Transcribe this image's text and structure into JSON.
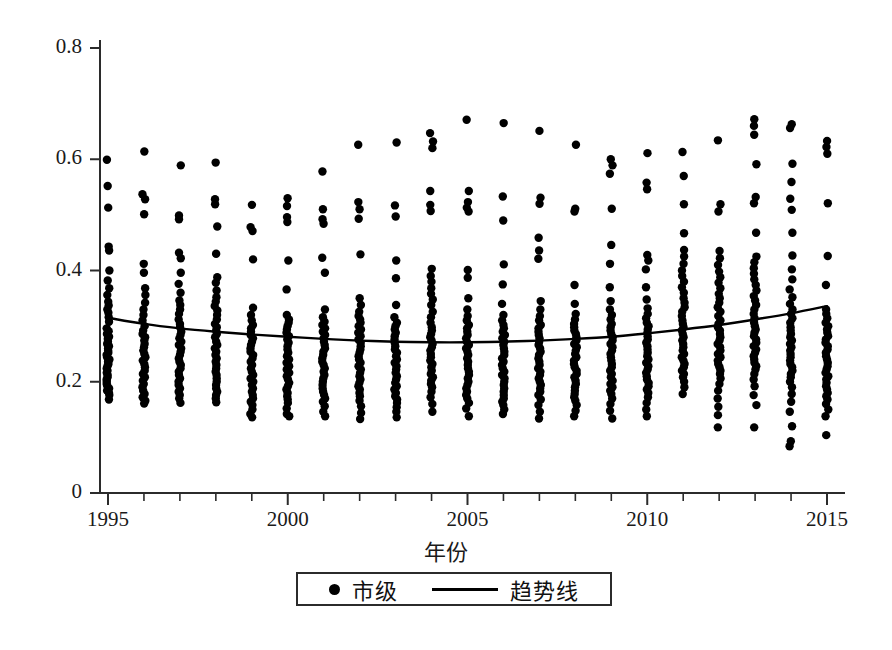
{
  "chart_data": {
    "type": "scatter",
    "title": "",
    "xlabel": "年份",
    "ylabel": "",
    "xlim": [
      1994.4,
      2015.6
    ],
    "ylim": [
      0,
      0.8
    ],
    "grid": false,
    "legend_position": "bottom-center",
    "axis_style": "open-left-bottom",
    "x_ticks": [
      1995,
      2000,
      2005,
      2010,
      2015
    ],
    "x_tick_labels": [
      "1995",
      "2000",
      "2005",
      "2010",
      "2015"
    ],
    "x_minor_ticks": [
      1996,
      1997,
      1998,
      1999,
      2001,
      2002,
      2003,
      2004,
      2006,
      2007,
      2008,
      2009,
      2011,
      2012,
      2013,
      2014
    ],
    "y_ticks": [
      0,
      0.2,
      0.4,
      0.6,
      0.8
    ],
    "y_tick_labels": [
      "0",
      "0.2",
      "0.4",
      "0.6",
      "0.8"
    ],
    "series": [
      {
        "name": "市级",
        "type": "scatter",
        "marker": "circle",
        "color": "#000000",
        "note": "Per-year vertical strip of municipal observations; dense core plus sparse high outliers.",
        "points_by_year": {
          "1995": [
            0.599,
            0.552,
            0.513,
            0.443,
            0.436,
            0.4,
            0.382,
            0.368,
            0.356,
            0.344,
            0.337,
            0.33,
            0.324,
            0.316,
            0.308,
            0.296,
            0.291,
            0.286,
            0.281,
            0.277,
            0.272,
            0.268,
            0.264,
            0.26,
            0.256,
            0.252,
            0.248,
            0.244,
            0.24,
            0.236,
            0.232,
            0.228,
            0.224,
            0.22,
            0.216,
            0.212,
            0.208,
            0.204,
            0.2,
            0.196,
            0.192,
            0.188,
            0.184,
            0.18,
            0.176,
            0.168
          ],
          "1996": [
            0.614,
            0.537,
            0.528,
            0.501,
            0.412,
            0.396,
            0.368,
            0.356,
            0.342,
            0.33,
            0.32,
            0.31,
            0.3,
            0.292,
            0.286,
            0.28,
            0.274,
            0.268,
            0.262,
            0.256,
            0.25,
            0.244,
            0.238,
            0.232,
            0.226,
            0.22,
            0.214,
            0.208,
            0.202,
            0.196,
            0.19,
            0.184,
            0.178,
            0.172,
            0.166,
            0.161
          ],
          "1997": [
            0.589,
            0.499,
            0.492,
            0.432,
            0.422,
            0.396,
            0.376,
            0.36,
            0.346,
            0.338,
            0.33,
            0.322,
            0.312,
            0.304,
            0.298,
            0.29,
            0.284,
            0.278,
            0.272,
            0.266,
            0.26,
            0.254,
            0.248,
            0.242,
            0.236,
            0.23,
            0.224,
            0.218,
            0.212,
            0.206,
            0.2,
            0.194,
            0.188,
            0.182,
            0.176,
            0.17,
            0.162
          ],
          "1998": [
            0.594,
            0.528,
            0.519,
            0.479,
            0.43,
            0.388,
            0.378,
            0.364,
            0.352,
            0.344,
            0.336,
            0.328,
            0.32,
            0.312,
            0.304,
            0.298,
            0.292,
            0.286,
            0.28,
            0.272,
            0.266,
            0.26,
            0.254,
            0.248,
            0.242,
            0.236,
            0.23,
            0.224,
            0.218,
            0.212,
            0.206,
            0.2,
            0.194,
            0.188,
            0.182,
            0.176,
            0.17,
            0.163
          ],
          "1999": [
            0.518,
            0.478,
            0.471,
            0.42,
            0.333,
            0.32,
            0.31,
            0.302,
            0.296,
            0.29,
            0.284,
            0.278,
            0.272,
            0.266,
            0.26,
            0.254,
            0.248,
            0.242,
            0.236,
            0.23,
            0.224,
            0.218,
            0.212,
            0.206,
            0.2,
            0.194,
            0.188,
            0.182,
            0.176,
            0.17,
            0.164,
            0.158,
            0.15,
            0.142,
            0.136
          ],
          "2000": [
            0.53,
            0.516,
            0.496,
            0.487,
            0.418,
            0.366,
            0.32,
            0.312,
            0.306,
            0.3,
            0.294,
            0.288,
            0.282,
            0.276,
            0.27,
            0.264,
            0.258,
            0.252,
            0.246,
            0.24,
            0.234,
            0.228,
            0.222,
            0.216,
            0.21,
            0.204,
            0.198,
            0.192,
            0.186,
            0.18,
            0.174,
            0.168,
            0.162,
            0.152,
            0.142,
            0.138
          ],
          "2001": [
            0.578,
            0.51,
            0.492,
            0.484,
            0.423,
            0.396,
            0.33,
            0.316,
            0.308,
            0.302,
            0.296,
            0.29,
            0.284,
            0.278,
            0.272,
            0.266,
            0.26,
            0.254,
            0.248,
            0.242,
            0.236,
            0.23,
            0.224,
            0.218,
            0.212,
            0.206,
            0.2,
            0.194,
            0.188,
            0.182,
            0.176,
            0.17,
            0.164,
            0.156,
            0.146,
            0.138
          ],
          "2002": [
            0.626,
            0.523,
            0.51,
            0.493,
            0.429,
            0.35,
            0.338,
            0.326,
            0.318,
            0.312,
            0.306,
            0.3,
            0.294,
            0.288,
            0.282,
            0.276,
            0.27,
            0.264,
            0.258,
            0.252,
            0.246,
            0.24,
            0.234,
            0.228,
            0.222,
            0.216,
            0.21,
            0.204,
            0.198,
            0.192,
            0.186,
            0.18,
            0.174,
            0.166,
            0.156,
            0.144,
            0.133
          ],
          "2003": [
            0.63,
            0.517,
            0.497,
            0.418,
            0.386,
            0.338,
            0.316,
            0.306,
            0.3,
            0.294,
            0.288,
            0.282,
            0.276,
            0.27,
            0.264,
            0.258,
            0.252,
            0.246,
            0.24,
            0.234,
            0.228,
            0.222,
            0.216,
            0.21,
            0.204,
            0.198,
            0.192,
            0.186,
            0.18,
            0.174,
            0.168,
            0.162,
            0.154,
            0.146,
            0.136
          ],
          "2004": [
            0.647,
            0.632,
            0.62,
            0.543,
            0.518,
            0.507,
            0.403,
            0.39,
            0.38,
            0.368,
            0.358,
            0.348,
            0.338,
            0.326,
            0.316,
            0.306,
            0.298,
            0.292,
            0.286,
            0.28,
            0.274,
            0.268,
            0.262,
            0.256,
            0.25,
            0.244,
            0.238,
            0.232,
            0.226,
            0.22,
            0.214,
            0.208,
            0.202,
            0.196,
            0.19,
            0.182,
            0.172,
            0.16,
            0.146
          ],
          "2005": [
            0.671,
            0.543,
            0.523,
            0.513,
            0.506,
            0.401,
            0.387,
            0.35,
            0.33,
            0.318,
            0.31,
            0.302,
            0.296,
            0.29,
            0.284,
            0.278,
            0.272,
            0.266,
            0.26,
            0.254,
            0.248,
            0.242,
            0.236,
            0.23,
            0.224,
            0.218,
            0.212,
            0.206,
            0.2,
            0.194,
            0.188,
            0.182,
            0.176,
            0.17,
            0.162,
            0.152,
            0.138
          ],
          "2006": [
            0.665,
            0.533,
            0.49,
            0.411,
            0.375,
            0.34,
            0.32,
            0.31,
            0.302,
            0.296,
            0.29,
            0.284,
            0.278,
            0.272,
            0.266,
            0.26,
            0.254,
            0.248,
            0.242,
            0.236,
            0.23,
            0.224,
            0.218,
            0.212,
            0.206,
            0.2,
            0.194,
            0.188,
            0.182,
            0.176,
            0.17,
            0.164,
            0.158,
            0.15,
            0.142
          ],
          "2007": [
            0.651,
            0.531,
            0.52,
            0.459,
            0.436,
            0.421,
            0.345,
            0.33,
            0.318,
            0.31,
            0.302,
            0.296,
            0.29,
            0.284,
            0.278,
            0.272,
            0.266,
            0.26,
            0.254,
            0.248,
            0.242,
            0.236,
            0.23,
            0.224,
            0.218,
            0.212,
            0.206,
            0.2,
            0.194,
            0.188,
            0.182,
            0.176,
            0.168,
            0.158,
            0.146,
            0.134
          ],
          "2008": [
            0.626,
            0.511,
            0.506,
            0.374,
            0.34,
            0.322,
            0.312,
            0.304,
            0.298,
            0.292,
            0.286,
            0.28,
            0.274,
            0.268,
            0.262,
            0.256,
            0.25,
            0.244,
            0.238,
            0.232,
            0.226,
            0.22,
            0.214,
            0.208,
            0.202,
            0.196,
            0.19,
            0.184,
            0.178,
            0.172,
            0.166,
            0.158,
            0.148,
            0.138
          ],
          "2009": [
            0.6,
            0.589,
            0.574,
            0.511,
            0.446,
            0.412,
            0.37,
            0.345,
            0.33,
            0.32,
            0.312,
            0.304,
            0.298,
            0.292,
            0.286,
            0.28,
            0.274,
            0.268,
            0.262,
            0.256,
            0.25,
            0.244,
            0.238,
            0.232,
            0.226,
            0.22,
            0.214,
            0.208,
            0.202,
            0.196,
            0.19,
            0.184,
            0.178,
            0.17,
            0.16,
            0.148,
            0.134
          ],
          "2010": [
            0.611,
            0.558,
            0.546,
            0.428,
            0.418,
            0.402,
            0.37,
            0.348,
            0.332,
            0.322,
            0.314,
            0.306,
            0.3,
            0.294,
            0.288,
            0.282,
            0.276,
            0.27,
            0.264,
            0.258,
            0.252,
            0.246,
            0.24,
            0.234,
            0.228,
            0.222,
            0.216,
            0.21,
            0.204,
            0.198,
            0.192,
            0.186,
            0.18,
            0.172,
            0.162,
            0.15,
            0.138
          ],
          "2011": [
            0.613,
            0.57,
            0.519,
            0.467,
            0.437,
            0.425,
            0.412,
            0.4,
            0.39,
            0.38,
            0.37,
            0.36,
            0.35,
            0.342,
            0.334,
            0.326,
            0.318,
            0.31,
            0.304,
            0.298,
            0.292,
            0.286,
            0.28,
            0.274,
            0.268,
            0.262,
            0.256,
            0.25,
            0.244,
            0.238,
            0.232,
            0.226,
            0.22,
            0.214,
            0.208,
            0.2,
            0.19,
            0.178
          ],
          "2012": [
            0.634,
            0.519,
            0.506,
            0.435,
            0.422,
            0.41,
            0.398,
            0.388,
            0.378,
            0.368,
            0.358,
            0.35,
            0.342,
            0.334,
            0.326,
            0.318,
            0.31,
            0.304,
            0.298,
            0.292,
            0.286,
            0.28,
            0.274,
            0.268,
            0.262,
            0.256,
            0.25,
            0.244,
            0.238,
            0.232,
            0.226,
            0.22,
            0.214,
            0.206,
            0.196,
            0.184,
            0.17,
            0.155,
            0.14,
            0.118
          ],
          "2013": [
            0.672,
            0.66,
            0.644,
            0.591,
            0.532,
            0.521,
            0.468,
            0.425,
            0.415,
            0.404,
            0.394,
            0.384,
            0.374,
            0.364,
            0.354,
            0.346,
            0.338,
            0.33,
            0.322,
            0.314,
            0.306,
            0.3,
            0.294,
            0.288,
            0.282,
            0.276,
            0.27,
            0.264,
            0.258,
            0.252,
            0.246,
            0.24,
            0.234,
            0.228,
            0.222,
            0.214,
            0.204,
            0.192,
            0.176,
            0.158,
            0.118
          ],
          "2014": [
            0.663,
            0.656,
            0.592,
            0.559,
            0.529,
            0.509,
            0.468,
            0.427,
            0.402,
            0.384,
            0.366,
            0.352,
            0.34,
            0.33,
            0.322,
            0.314,
            0.306,
            0.298,
            0.292,
            0.286,
            0.28,
            0.274,
            0.268,
            0.262,
            0.256,
            0.25,
            0.244,
            0.238,
            0.232,
            0.226,
            0.22,
            0.214,
            0.208,
            0.2,
            0.19,
            0.178,
            0.164,
            0.146,
            0.12,
            0.093,
            0.084
          ],
          "2015": [
            0.633,
            0.622,
            0.61,
            0.521,
            0.426,
            0.374,
            0.33,
            0.322,
            0.314,
            0.306,
            0.3,
            0.294,
            0.288,
            0.282,
            0.276,
            0.27,
            0.264,
            0.258,
            0.252,
            0.246,
            0.24,
            0.234,
            0.228,
            0.222,
            0.216,
            0.21,
            0.204,
            0.198,
            0.192,
            0.186,
            0.18,
            0.174,
            0.168,
            0.16,
            0.15,
            0.138,
            0.104
          ]
        }
      },
      {
        "name": "趋势线",
        "type": "line",
        "color": "#000000",
        "x": [
          1995,
          1996,
          1997,
          1998,
          1999,
          2000,
          2001,
          2002,
          2003,
          2004,
          2005,
          2006,
          2007,
          2008,
          2009,
          2010,
          2011,
          2012,
          2013,
          2014,
          2015
        ],
        "values": [
          0.315,
          0.304,
          0.296,
          0.29,
          0.285,
          0.281,
          0.277,
          0.274,
          0.272,
          0.271,
          0.271,
          0.272,
          0.274,
          0.277,
          0.281,
          0.287,
          0.294,
          0.302,
          0.312,
          0.323,
          0.336
        ]
      }
    ]
  },
  "axis": {
    "y_labels": [
      "0.8",
      "0.6",
      "0.4",
      "0.2",
      "0"
    ],
    "x_labels": [
      "1995",
      "2000",
      "2005",
      "2010",
      "2015"
    ],
    "x_title": "年份"
  },
  "legend": {
    "entries": [
      {
        "label": "市级",
        "marker": "dot-marker-icon"
      },
      {
        "label": "趋势线",
        "marker": "line-marker-icon"
      }
    ]
  }
}
